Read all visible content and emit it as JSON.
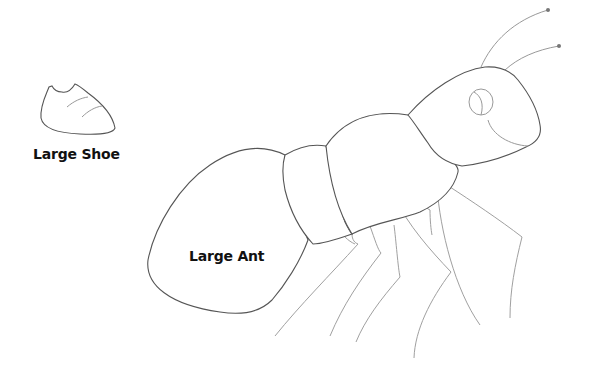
{
  "objects": [
    {
      "id": "shoe",
      "label": "Large Shoe"
    },
    {
      "id": "ant",
      "label": "Large Ant"
    }
  ],
  "colors": {
    "background": "#ffffff",
    "outline": "#555555",
    "inner_lines": "#999999",
    "label_text": "#111111",
    "antenna_tip": "#777777"
  }
}
